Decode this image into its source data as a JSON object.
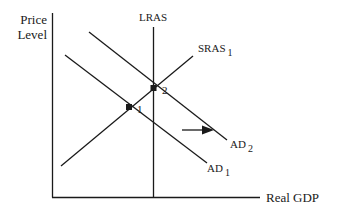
{
  "diagram": {
    "type": "AD-AS model",
    "y_axis_label_line1": "Price",
    "y_axis_label_line2": "Level",
    "x_axis_label": "Real GDP",
    "curves": {
      "lras": {
        "label": "LRAS"
      },
      "sras": {
        "label": "SRAS",
        "subscript": "1"
      },
      "ad1": {
        "label": "AD",
        "subscript": "1"
      },
      "ad2": {
        "label": "AD",
        "subscript": "2"
      }
    },
    "points": [
      {
        "label": "1"
      },
      {
        "label": "2"
      }
    ],
    "arrow": {
      "direction": "right",
      "meaning": "AD shift from AD1 to AD2"
    },
    "colors": {
      "line": "#1a1a1a",
      "background": "#ffffff"
    }
  }
}
